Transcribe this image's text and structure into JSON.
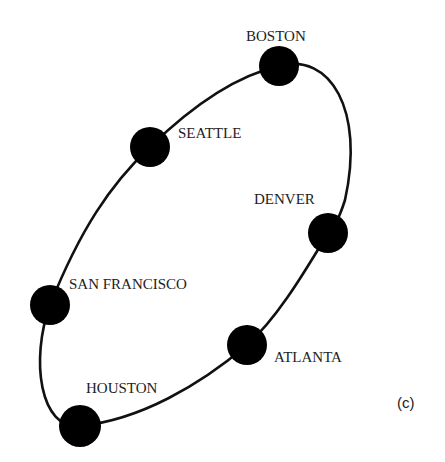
{
  "diagram": {
    "type": "ring-topology",
    "panel_label": "(c)",
    "nodes": [
      {
        "id": "boston",
        "label": "BOSTON",
        "x": 279,
        "y": 66
      },
      {
        "id": "seattle",
        "label": "SEATTLE",
        "x": 150,
        "y": 147
      },
      {
        "id": "denver",
        "label": "DENVER",
        "x": 328,
        "y": 233
      },
      {
        "id": "san-francisco",
        "label": "SAN FRANCISCO",
        "x": 50,
        "y": 305
      },
      {
        "id": "atlanta",
        "label": "ATLANTA",
        "x": 247,
        "y": 345
      },
      {
        "id": "houston",
        "label": "HOUSTON",
        "x": 80,
        "y": 426
      }
    ],
    "edges": [
      [
        "boston",
        "denver"
      ],
      [
        "denver",
        "atlanta"
      ],
      [
        "atlanta",
        "houston"
      ],
      [
        "houston",
        "san-francisco"
      ],
      [
        "san-francisco",
        "seattle"
      ],
      [
        "seattle",
        "boston"
      ]
    ]
  }
}
